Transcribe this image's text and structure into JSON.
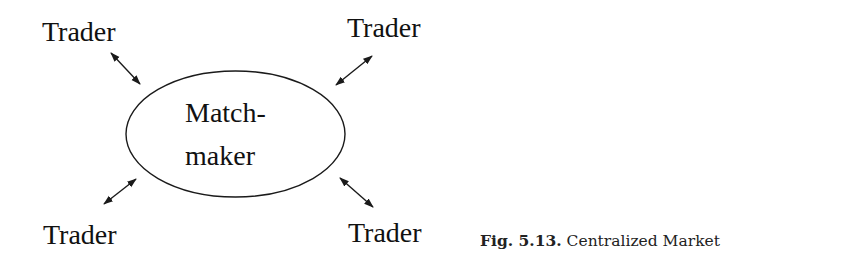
{
  "diagram": {
    "center_node": {
      "line1": "Match-",
      "line2": "maker",
      "shape": "ellipse"
    },
    "traders": [
      {
        "label": "Trader",
        "position": "top-left"
      },
      {
        "label": "Trader",
        "position": "top-right"
      },
      {
        "label": "Trader",
        "position": "bottom-left"
      },
      {
        "label": "Trader",
        "position": "bottom-right"
      }
    ],
    "connectors": "bidirectional-arrows",
    "stroke_color": "#1a1a1a"
  },
  "caption": {
    "figure_number": "Fig. 5.13.",
    "title": "Centralized Market"
  }
}
